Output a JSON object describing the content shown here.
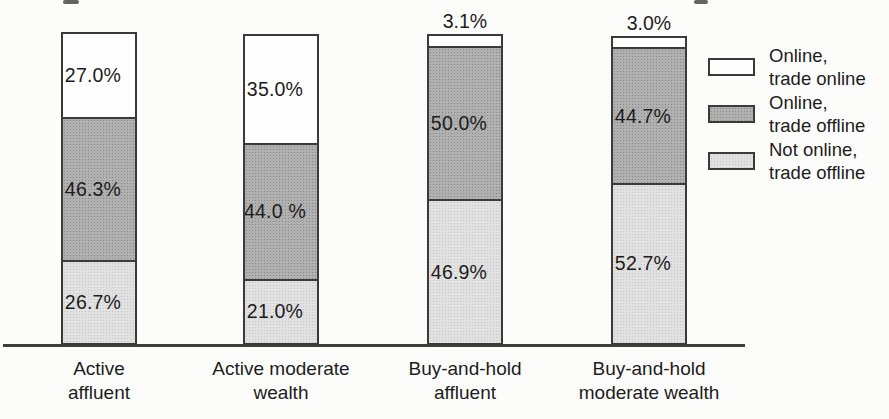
{
  "chart_data": {
    "type": "bar",
    "stacked": true,
    "title": "",
    "categories": [
      "Active affluent",
      "Active moderate wealth",
      "Buy-and-hold affluent",
      "Buy-and-hold moderate wealth"
    ],
    "series": [
      {
        "name": "Online, trade online",
        "color": "#fefefe",
        "values": [
          27.0,
          35.0,
          3.1,
          3.0
        ]
      },
      {
        "name": "Online, trade offline",
        "color": "#a9a9a9",
        "values": [
          46.3,
          44.0,
          50.0,
          44.7
        ]
      },
      {
        "name": "Not online, trade offline",
        "color": "#d9d9d9",
        "values": [
          26.7,
          21.0,
          46.9,
          52.7
        ]
      }
    ],
    "value_unit": "%",
    "ylim": [
      0,
      100
    ],
    "grid": false,
    "legend_position": "right"
  },
  "bars": [
    {
      "label_line1": "Active",
      "label_line2": "affluent",
      "segments": {
        "top": "27.0%",
        "middle": "46.3%",
        "bottom": "26.7%"
      }
    },
    {
      "label_line1": "Active moderate",
      "label_line2": "wealth",
      "segments": {
        "top": "35.0%",
        "middle": "44.0 %",
        "bottom": "21.0%"
      }
    },
    {
      "label_line1": "Buy-and-hold",
      "label_line2": "affluent",
      "above": "3.1%",
      "segments": {
        "middle": "50.0%",
        "bottom": "46.9%"
      }
    },
    {
      "label_line1": "Buy-and-hold",
      "label_line2": "moderate wealth",
      "above": "3.0%",
      "segments": {
        "middle": "44.7%",
        "bottom": "52.7%"
      }
    }
  ],
  "legend": {
    "items": [
      {
        "line1": "Online,",
        "line2": "trade online"
      },
      {
        "line1": "Online,",
        "line2": "trade offline"
      },
      {
        "line1": "Not online,",
        "line2": "trade offline"
      }
    ]
  },
  "colors": {
    "segment_white": "#fefefe",
    "segment_dark": "#a9a9a9",
    "segment_light": "#d9d9d9",
    "border": "#3a3a3a",
    "axis": "#3e3e3e",
    "text": "#1c1c1c",
    "background": "#fcfcfb"
  }
}
